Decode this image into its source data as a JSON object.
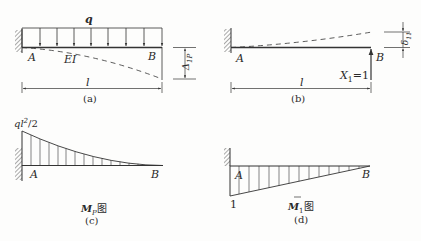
{
  "figures": {
    "a": {
      "caption": "(a)",
      "load_label": "q",
      "support_label_left": "A",
      "support_label_right": "B",
      "stiffness_label": "EI",
      "span_label": "l",
      "deflection_label": "Δ",
      "deflection_sub": "1P",
      "load_arrow_count": 8
    },
    "b": {
      "caption": "(b)",
      "support_label_left": "A",
      "support_label_right": "B",
      "span_label": "l",
      "force_label": "X",
      "force_sub": "1",
      "force_value": "=1",
      "deflection_label": "δ",
      "deflection_sub": "11"
    },
    "c": {
      "caption": "(c)",
      "title_main": "M",
      "title_sub": "P",
      "title_suffix": "图",
      "max_moment_label_a": "ql",
      "max_moment_label_sup": "2",
      "max_moment_label_b": "/2",
      "support_label_left": "A",
      "support_label_right": "B"
    },
    "d": {
      "caption": "(d)",
      "title_main": "M",
      "title_sub": "1",
      "title_suffix": "图",
      "max_value_label": "1",
      "support_label_left": "A",
      "support_label_right": "B"
    }
  },
  "colors": {
    "line": "#333333",
    "hatch": "#555555",
    "background": "#fdfdfc"
  }
}
